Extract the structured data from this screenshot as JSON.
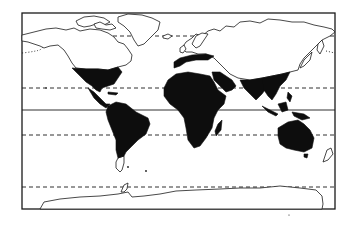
{
  "figure": {
    "type": "world-map",
    "projection": "cylindrical",
    "style": "black-and-white line drawing",
    "colors": {
      "background": "#ffffff",
      "outline": "#1a1a1a",
      "shaded_region": "#0d0d0d"
    },
    "frame": {
      "x": 22,
      "y": 13,
      "width": 313,
      "height": 196
    }
  },
  "reference_lines": [
    {
      "name": "arctic-circle",
      "style": "dashed",
      "y": 36
    },
    {
      "name": "tropic-of-cancer",
      "style": "dashed",
      "y": 88
    },
    {
      "name": "equator",
      "style": "solid",
      "y": 110
    },
    {
      "name": "tropic-of-capricorn",
      "style": "dashed",
      "y": 135
    },
    {
      "name": "antarctic-circle",
      "style": "dashed",
      "y": 187
    }
  ],
  "shaded_regions": [
    "southern-north-america-and-mexico",
    "central-america-and-caribbean",
    "south-america",
    "southern-europe-mediterranean",
    "africa",
    "madagascar",
    "middle-east",
    "south-asia-india",
    "southeast-asia",
    "indonesia-philippines",
    "australia",
    "tasmania"
  ],
  "unshaded_regions": [
    "canada-alaska",
    "greenland",
    "northern-europe",
    "russia-siberia",
    "central-asia",
    "china-north",
    "japan",
    "patagonia",
    "new-zealand",
    "antarctica"
  ]
}
